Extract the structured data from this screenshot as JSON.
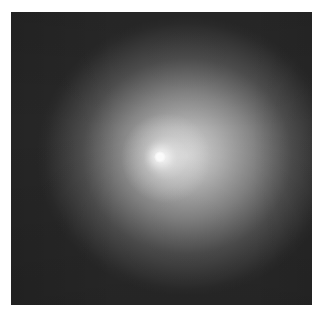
{
  "image": {
    "subject": "comet-like diffuse glow with bright nucleus",
    "alt": "Grayscale photograph of a bright point nucleus surrounded by a diffuse circular glow on a dark background",
    "colors": {
      "background_frame": "#ffffff",
      "sky": "#2a2a2a",
      "coma": "#b9b9b9",
      "nucleus": "#ffffff"
    }
  }
}
